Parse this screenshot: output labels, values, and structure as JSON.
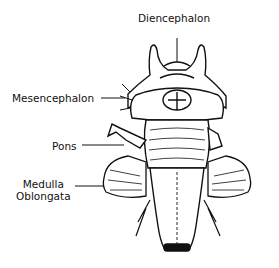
{
  "diagram": {
    "labels": [
      {
        "id": "diencephalon",
        "text": "Diencephalon"
      },
      {
        "id": "mesencephalon",
        "text": "Mesencephalon"
      },
      {
        "id": "pons",
        "text": "Pons"
      },
      {
        "id": "medulla",
        "line1": "Medulla",
        "line2": "Oblongata"
      }
    ],
    "colors": {
      "ink": "#111111",
      "background": "#ffffff"
    }
  }
}
